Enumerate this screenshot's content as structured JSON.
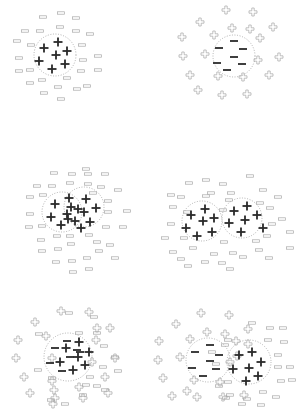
{
  "figure": {
    "width": 306,
    "height": 419,
    "background": "#ffffff",
    "colors": {
      "solid_symbol": "#2a2a2a",
      "outline_symbol": "#a8a8a8",
      "circle": "#a0a0a0"
    }
  },
  "panels": [
    {
      "id": "a",
      "circles": [
        {
          "cx": 55,
          "cy": 55,
          "r": 21
        }
      ],
      "solid_plus": [
        [
          58,
          42
        ],
        [
          44,
          48
        ],
        [
          67,
          51
        ],
        [
          56,
          55
        ],
        [
          39,
          61
        ],
        [
          65,
          64
        ],
        [
          52,
          69
        ]
      ],
      "solid_minus": [],
      "outline_minus": [
        [
          43,
          17
        ],
        [
          61,
          13
        ],
        [
          76,
          18
        ],
        [
          25,
          31
        ],
        [
          40,
          31
        ],
        [
          60,
          27
        ],
        [
          76,
          31
        ],
        [
          90,
          34
        ],
        [
          17,
          41
        ],
        [
          31,
          45
        ],
        [
          82,
          45
        ],
        [
          19,
          58
        ],
        [
          98,
          56
        ],
        [
          83,
          60
        ],
        [
          19,
          71
        ],
        [
          30,
          70
        ],
        [
          81,
          71
        ],
        [
          98,
          70
        ],
        [
          67,
          78
        ],
        [
          42,
          80
        ],
        [
          87,
          86
        ],
        [
          30,
          83
        ],
        [
          58,
          87
        ],
        [
          77,
          89
        ],
        [
          44,
          93
        ],
        [
          61,
          99
        ]
      ],
      "outline_plus": []
    },
    {
      "id": "b",
      "circles": [
        {
          "cx": 234,
          "cy": 56,
          "r": 21
        }
      ],
      "solid_plus": [],
      "solid_minus": [
        [
          234,
          41
        ],
        [
          219,
          48
        ],
        [
          243,
          49
        ],
        [
          234,
          57
        ],
        [
          217,
          63
        ],
        [
          242,
          64
        ],
        [
          227,
          70
        ]
      ],
      "outline_minus": [],
      "outline_plus": [
        [
          226,
          10
        ],
        [
          253,
          12
        ],
        [
          200,
          22
        ],
        [
          232,
          28
        ],
        [
          250,
          29
        ],
        [
          273,
          27
        ],
        [
          182,
          37
        ],
        [
          214,
          35
        ],
        [
          260,
          38
        ],
        [
          183,
          56
        ],
        [
          205,
          54
        ],
        [
          258,
          60
        ],
        [
          279,
          57
        ],
        [
          190,
          75
        ],
        [
          218,
          76
        ],
        [
          243,
          77
        ],
        [
          269,
          75
        ],
        [
          198,
          90
        ],
        [
          222,
          95
        ],
        [
          247,
          94
        ]
      ]
    },
    {
      "id": "c",
      "circles": [
        {
          "cx": 62,
          "cy": 212,
          "r": 20
        },
        {
          "cx": 84,
          "cy": 207,
          "r": 20
        }
      ],
      "solid_plus": [
        [
          55,
          204
        ],
        [
          69,
          198
        ],
        [
          86,
          199
        ],
        [
          71,
          207
        ],
        [
          78,
          209
        ],
        [
          84,
          212
        ],
        [
          96,
          208
        ],
        [
          51,
          217
        ],
        [
          67,
          214
        ],
        [
          68,
          219
        ],
        [
          75,
          221
        ],
        [
          81,
          228
        ],
        [
          90,
          222
        ],
        [
          61,
          225
        ]
      ],
      "solid_minus": [],
      "outline_minus": [
        [
          54,
          173
        ],
        [
          72,
          174
        ],
        [
          86,
          169
        ],
        [
          88,
          174
        ],
        [
          105,
          174
        ],
        [
          37,
          186
        ],
        [
          52,
          186
        ],
        [
          70,
          183
        ],
        [
          88,
          184
        ],
        [
          101,
          187
        ],
        [
          118,
          190
        ],
        [
          30,
          197
        ],
        [
          43,
          195
        ],
        [
          93,
          193
        ],
        [
          108,
          201
        ],
        [
          127,
          211
        ],
        [
          30,
          214
        ],
        [
          108,
          212
        ],
        [
          29,
          227
        ],
        [
          42,
          226
        ],
        [
          106,
          227
        ],
        [
          123,
          227
        ],
        [
          41,
          240
        ],
        [
          57,
          236
        ],
        [
          70,
          236
        ],
        [
          89,
          235
        ],
        [
          42,
          251
        ],
        [
          58,
          249
        ],
        [
          71,
          244
        ],
        [
          97,
          242
        ],
        [
          110,
          245
        ],
        [
          115,
          258
        ],
        [
          56,
          262
        ],
        [
          72,
          261
        ],
        [
          87,
          258
        ],
        [
          99,
          251
        ],
        [
          89,
          269
        ],
        [
          73,
          272
        ]
      ],
      "outline_plus": []
    },
    {
      "id": "d",
      "circles": [
        {
          "cx": 202,
          "cy": 221,
          "r": 20
        },
        {
          "cx": 242,
          "cy": 218,
          "r": 20
        }
      ],
      "solid_plus": [
        [
          191,
          215
        ],
        [
          205,
          209
        ],
        [
          214,
          218
        ],
        [
          203,
          221
        ],
        [
          186,
          228
        ],
        [
          197,
          236
        ],
        [
          212,
          232
        ],
        [
          234,
          211
        ],
        [
          247,
          206
        ],
        [
          257,
          215
        ],
        [
          229,
          223
        ],
        [
          245,
          220
        ],
        [
          263,
          228
        ],
        [
          241,
          232
        ]
      ],
      "solid_minus": [],
      "outline_minus": [
        [
          250,
          176
        ],
        [
          206,
          180
        ],
        [
          223,
          184
        ],
        [
          189,
          183
        ],
        [
          231,
          193
        ],
        [
          263,
          190
        ],
        [
          211,
          193
        ],
        [
          171,
          195
        ],
        [
          181,
          197
        ],
        [
          206,
          196
        ],
        [
          229,
          200
        ],
        [
          260,
          203
        ],
        [
          278,
          197
        ],
        [
          187,
          212
        ],
        [
          223,
          210
        ],
        [
          173,
          207
        ],
        [
          270,
          208
        ],
        [
          282,
          219
        ],
        [
          171,
          224
        ],
        [
          272,
          224
        ],
        [
          290,
          232
        ],
        [
          184,
          238
        ],
        [
          165,
          238
        ],
        [
          267,
          236
        ],
        [
          224,
          242
        ],
        [
          256,
          241
        ],
        [
          290,
          248
        ],
        [
          193,
          248
        ],
        [
          214,
          254
        ],
        [
          173,
          252
        ],
        [
          233,
          253
        ],
        [
          259,
          250
        ],
        [
          269,
          258
        ],
        [
          243,
          257
        ],
        [
          181,
          259
        ],
        [
          222,
          263
        ],
        [
          205,
          262
        ],
        [
          188,
          266
        ],
        [
          230,
          269
        ]
      ],
      "outline_plus": []
    },
    {
      "id": "e",
      "circles": [
        {
          "cx": 68,
          "cy": 357,
          "r": 24
        }
      ],
      "solid_plus": [
        [
          79,
          342
        ],
        [
          66,
          348
        ],
        [
          89,
          352
        ],
        [
          78,
          357
        ],
        [
          60,
          362
        ],
        [
          85,
          365
        ],
        [
          73,
          370
        ]
      ],
      "solid_minus": [
        [
          55,
          348
        ],
        [
          67,
          341
        ],
        [
          77,
          350
        ],
        [
          50,
          363
        ],
        [
          62,
          371
        ],
        [
          70,
          357
        ],
        [
          80,
          352
        ]
      ],
      "outline_minus": [
        [
          69,
          313
        ],
        [
          94,
          317
        ],
        [
          39,
          334
        ],
        [
          79,
          333
        ],
        [
          97,
          333
        ],
        [
          104,
          346
        ],
        [
          115,
          357
        ],
        [
          103,
          367
        ],
        [
          118,
          371
        ],
        [
          90,
          377
        ],
        [
          38,
          370
        ],
        [
          52,
          378
        ],
        [
          86,
          385
        ],
        [
          97,
          386
        ],
        [
          105,
          390
        ],
        [
          83,
          395
        ],
        [
          51,
          400
        ],
        [
          65,
          404
        ]
      ],
      "outline_plus": [
        [
          61,
          311
        ],
        [
          89,
          312
        ],
        [
          35,
          322
        ],
        [
          97,
          328
        ],
        [
          110,
          328
        ],
        [
          46,
          336
        ],
        [
          18,
          340
        ],
        [
          96,
          340
        ],
        [
          52,
          358
        ],
        [
          115,
          358
        ],
        [
          16,
          358
        ],
        [
          92,
          362
        ],
        [
          24,
          377
        ],
        [
          105,
          377
        ],
        [
          52,
          381
        ],
        [
          54,
          390
        ],
        [
          79,
          387
        ],
        [
          108,
          393
        ],
        [
          30,
          393
        ],
        [
          55,
          398
        ],
        [
          83,
          398
        ],
        [
          53,
          404
        ]
      ]
    },
    {
      "id": "f",
      "circles": [
        {
          "cx": 208,
          "cy": 360,
          "r": 22
        },
        {
          "cx": 249,
          "cy": 362,
          "r": 22
        }
      ],
      "solid_plus": [
        [
          239,
          355
        ],
        [
          252,
          352
        ],
        [
          261,
          362
        ],
        [
          233,
          369
        ],
        [
          249,
          368
        ],
        [
          258,
          376
        ],
        [
          246,
          381
        ]
      ],
      "solid_minus": [
        [
          210,
          345
        ],
        [
          195,
          352
        ],
        [
          219,
          355
        ],
        [
          210,
          361
        ],
        [
          192,
          368
        ],
        [
          216,
          369
        ],
        [
          203,
          376
        ]
      ],
      "outline_minus": [
        [
          252,
          323
        ],
        [
          270,
          328
        ],
        [
          283,
          328
        ],
        [
          228,
          340
        ],
        [
          268,
          340
        ],
        [
          284,
          342
        ],
        [
          278,
          355
        ],
        [
          212,
          352
        ],
        [
          216,
          364
        ],
        [
          225,
          345
        ],
        [
          278,
          367
        ],
        [
          290,
          367
        ],
        [
          292,
          380
        ],
        [
          281,
          381
        ],
        [
          263,
          392
        ],
        [
          228,
          382
        ],
        [
          219,
          386
        ],
        [
          230,
          395
        ],
        [
          247,
          399
        ],
        [
          276,
          397
        ],
        [
          242,
          404
        ],
        [
          261,
          405
        ],
        [
          226,
          398
        ]
      ],
      "outline_plus": [
        [
          201,
          313
        ],
        [
          229,
          315
        ],
        [
          176,
          324
        ],
        [
          207,
          332
        ],
        [
          225,
          334
        ],
        [
          248,
          329
        ],
        [
          190,
          339
        ],
        [
          159,
          341
        ],
        [
          236,
          341
        ],
        [
          248,
          344
        ],
        [
          180,
          357
        ],
        [
          158,
          360
        ],
        [
          230,
          362
        ],
        [
          237,
          356
        ],
        [
          194,
          380
        ],
        [
          163,
          378
        ],
        [
          220,
          382
        ],
        [
          172,
          396
        ],
        [
          197,
          397
        ],
        [
          223,
          397
        ],
        [
          244,
          395
        ],
        [
          187,
          391
        ]
      ]
    }
  ]
}
